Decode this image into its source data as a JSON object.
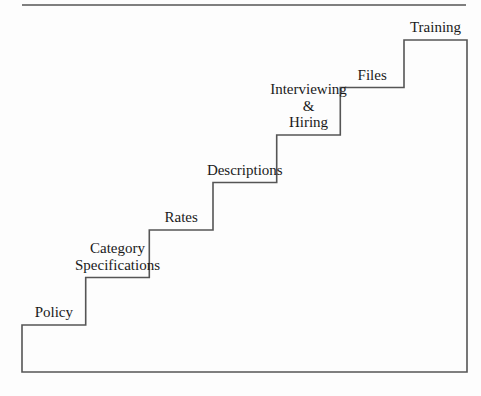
{
  "diagram": {
    "type": "staircase",
    "steps": [
      {
        "label_lines": [
          "Policy"
        ]
      },
      {
        "label_lines": [
          "Category",
          "Specifications"
        ]
      },
      {
        "label_lines": [
          "Rates"
        ]
      },
      {
        "label_lines": [
          "Descriptions"
        ]
      },
      {
        "label_lines": [
          "Interviewing",
          "&",
          "Hiring"
        ]
      },
      {
        "label_lines": [
          "Files"
        ]
      },
      {
        "label_lines": [
          "Training"
        ]
      }
    ],
    "colors": {
      "line": "#555555",
      "text": "#1a1a1a",
      "background": "#fdfdfd"
    }
  }
}
